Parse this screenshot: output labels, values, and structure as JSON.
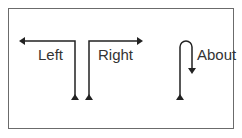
{
  "diagram": {
    "labels": {
      "left": "Left",
      "right": "Right",
      "about": "About"
    },
    "colors": {
      "stroke": "#222222",
      "frame": "#6b6b6b",
      "text": "#333333"
    }
  }
}
